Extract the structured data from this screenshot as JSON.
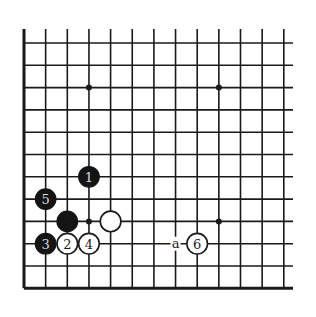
{
  "diagram": {
    "type": "go-board-fragment",
    "columns": 13,
    "rows": 12,
    "edges": {
      "left": true,
      "bottom": true,
      "top": false,
      "right": false
    },
    "star_points": [
      [
        3,
        2
      ],
      [
        9,
        2
      ],
      [
        3,
        8
      ],
      [
        9,
        8
      ]
    ],
    "stones": [
      {
        "color": "black",
        "col": 3,
        "row": 6,
        "label": "1"
      },
      {
        "color": "white",
        "col": 2,
        "row": 9,
        "label": "2"
      },
      {
        "color": "black",
        "col": 1,
        "row": 9,
        "label": "3"
      },
      {
        "color": "white",
        "col": 3,
        "row": 9,
        "label": "4"
      },
      {
        "color": "black",
        "col": 1,
        "row": 7,
        "label": "5"
      },
      {
        "color": "white",
        "col": 8,
        "row": 9,
        "label": "6"
      },
      {
        "color": "black",
        "col": 2,
        "row": 8,
        "label": ""
      },
      {
        "color": "white",
        "col": 4,
        "row": 8,
        "label": ""
      }
    ],
    "markers": [
      {
        "col": 7,
        "row": 9,
        "label": "a"
      }
    ],
    "colors": {
      "black_stone": "#141414",
      "white_stone": "#ffffff",
      "line": "#1a1a1a",
      "black_number": "#d9d9d9"
    }
  }
}
